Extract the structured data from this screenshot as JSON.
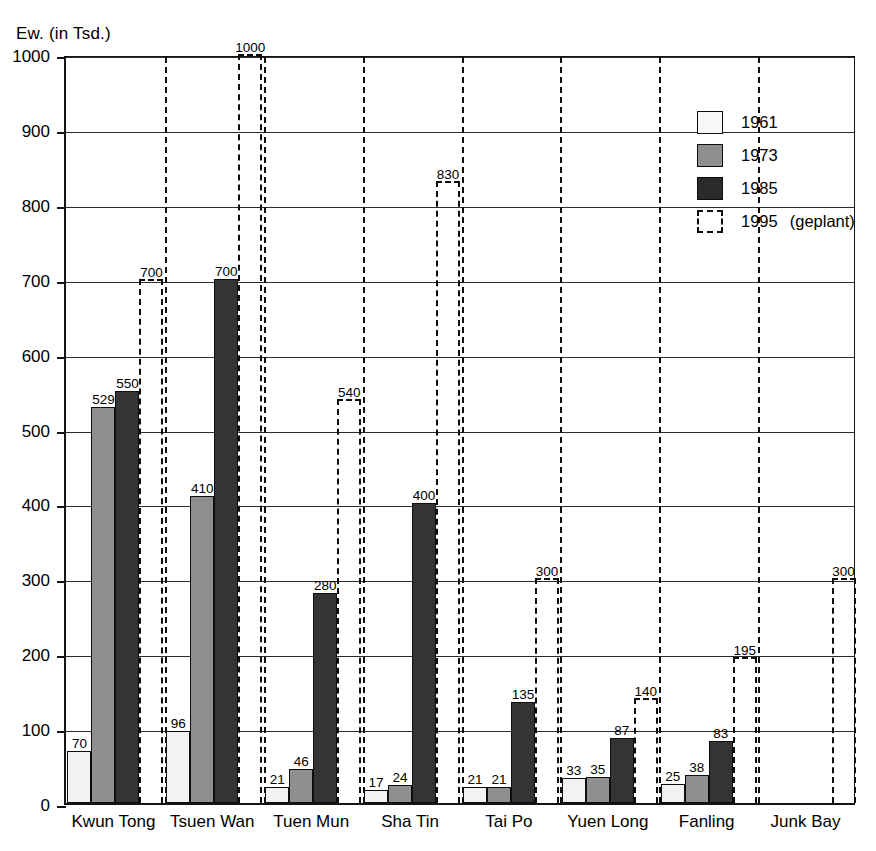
{
  "chart_data": {
    "type": "bar",
    "title": "",
    "ylabel": "Ew. (in Tsd.)",
    "xlabel": "",
    "ylim": [
      0,
      1000
    ],
    "yticks": [
      0,
      100,
      200,
      300,
      400,
      500,
      600,
      700,
      800,
      900,
      1000
    ],
    "grid": true,
    "legend_position": "top-right",
    "categories": [
      "Kwun Tong",
      "Tsuen Wan",
      "Tuen Mun",
      "Sha Tin",
      "Tai Po",
      "Yuen Long",
      "Fanling",
      "Junk Bay"
    ],
    "series": [
      {
        "name": "1961",
        "style": "light",
        "color": "#f2f2f2",
        "values": [
          70,
          96,
          21,
          17,
          21,
          33,
          25,
          null
        ]
      },
      {
        "name": "1973",
        "style": "gray",
        "color": "#8f8f8f",
        "values": [
          529,
          410,
          46,
          24,
          21,
          35,
          38,
          null
        ]
      },
      {
        "name": "1985",
        "style": "dark",
        "color": "#343434",
        "values": [
          550,
          700,
          280,
          400,
          135,
          87,
          83,
          null
        ]
      },
      {
        "name": "1995 (geplant)",
        "style": "dashed",
        "color": "#ffffff",
        "values": [
          700,
          1000,
          540,
          830,
          300,
          140,
          195,
          300
        ]
      }
    ]
  },
  "legend": {
    "items": [
      {
        "label": "1961",
        "note": ""
      },
      {
        "label": "1973",
        "note": ""
      },
      {
        "label": "1985",
        "note": ""
      },
      {
        "label": "1995",
        "note": "(geplant)"
      }
    ]
  },
  "colors": {
    "axis": "#151515",
    "grid": "#2b2b2b",
    "bar_1961": "#f2f2f2",
    "bar_1973": "#8f8f8f",
    "bar_1985": "#343434",
    "bar_1995_outline": "#0d0d0d"
  }
}
